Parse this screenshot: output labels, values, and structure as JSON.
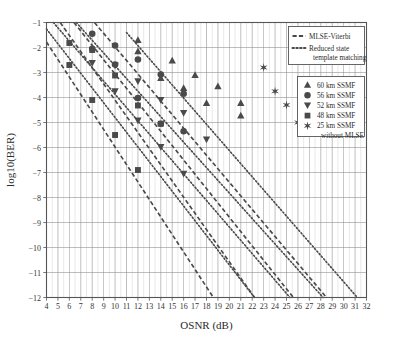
{
  "chart_data": {
    "type": "line",
    "title": "",
    "xlabel": "OSNR (dB)",
    "ylabel": "log10(BER)",
    "xlim": [
      4,
      32
    ],
    "ylim": [
      -12,
      -1
    ],
    "xticks": [
      4,
      5,
      6,
      7,
      8,
      9,
      10,
      11,
      12,
      13,
      14,
      15,
      16,
      17,
      18,
      19,
      20,
      21,
      22,
      23,
      24,
      25,
      26,
      27,
      28,
      29,
      30,
      31,
      32
    ],
    "yticks": [
      -1,
      -2,
      -3,
      -4,
      -5,
      -6,
      -7,
      -8,
      -9,
      -10,
      -11,
      -12
    ],
    "xtick_labels": [
      "4",
      "5",
      "6",
      "7",
      "8",
      "9",
      "10",
      "11",
      "12",
      "13",
      "14",
      "15",
      "16",
      "17",
      "18",
      "19",
      "20",
      "21",
      "22",
      "23",
      "24",
      "25",
      "26",
      "27",
      "28",
      "29",
      "30",
      "31",
      "32"
    ],
    "ytick_labels": [
      "−1",
      "−2",
      "−3",
      "−4",
      "−5",
      "−6",
      "−7",
      "−8",
      "−9",
      "−10",
      "−11",
      "−12"
    ],
    "grid": true,
    "legend_position": "upper-right",
    "series": [
      {
        "name": "48 km SSMF MLSE-Viterbi",
        "distance_km": 48,
        "method": "MLSE-Viterbi",
        "style": "dashed",
        "marker": "square",
        "line": [
          [
            4,
            -1.78
          ],
          [
            18.6,
            -12.0
          ]
        ],
        "points": [
          [
            6,
            -2.7
          ],
          [
            8,
            -4.1
          ],
          [
            10,
            -5.5
          ],
          [
            12,
            -6.9
          ]
        ]
      },
      {
        "name": "48 km SSMF Reduced state template matching",
        "distance_km": 48,
        "method": "Reduced state template matching",
        "style": "dotted",
        "marker": "square",
        "line": [
          [
            4,
            -1.26
          ],
          [
            22.2,
            -12.0
          ]
        ],
        "points": [
          [
            6,
            -1.82
          ],
          [
            8,
            -2.1
          ],
          [
            10,
            -3.12
          ],
          [
            12,
            -4.32
          ],
          [
            14,
            -5.05
          ]
        ]
      },
      {
        "name": "52 km SSMF MLSE-Viterbi",
        "distance_km": 52,
        "method": "MLSE-Viterbi",
        "style": "dashed",
        "marker": "triangle-down",
        "line": [
          [
            5.2,
            -1.0
          ],
          [
            22.2,
            -12.0
          ]
        ],
        "points": [
          [
            8,
            -2.62
          ],
          [
            10,
            -3.75
          ],
          [
            12,
            -4.92
          ],
          [
            14,
            -5.98
          ],
          [
            16,
            -7.05
          ]
        ]
      },
      {
        "name": "52 km SSMF Reduced state template matching",
        "distance_km": 52,
        "method": "Reduced state template matching",
        "style": "dotted",
        "marker": "triangle-down",
        "line": [
          [
            4.6,
            -1.0
          ],
          [
            25.3,
            -12.0
          ]
        ],
        "points": [
          [
            10,
            -2.72
          ],
          [
            12,
            -3.35
          ],
          [
            14,
            -4.1
          ],
          [
            16,
            -4.62
          ],
          [
            18,
            -5.68
          ]
        ]
      },
      {
        "name": "56 km SSMF MLSE-Viterbi",
        "distance_km": 56,
        "method": "MLSE-Viterbi",
        "style": "dashed",
        "marker": "circle",
        "line": [
          [
            6.4,
            -1.0
          ],
          [
            25.6,
            -12.0
          ]
        ],
        "points": [
          [
            8,
            -2.05
          ],
          [
            10,
            -2.68
          ],
          [
            12,
            -4.02
          ],
          [
            14,
            -5.05
          ],
          [
            16,
            -5.35
          ]
        ]
      },
      {
        "name": "56 km SSMF Reduced state template matching",
        "distance_km": 56,
        "method": "Reduced state template matching",
        "style": "dotted",
        "marker": "circle",
        "line": [
          [
            6.6,
            -1.0
          ],
          [
            28.2,
            -12.0
          ]
        ],
        "points": [
          [
            8,
            -1.45
          ],
          [
            10,
            -1.92
          ],
          [
            12,
            -2.48
          ],
          [
            14,
            -3.08
          ],
          [
            16,
            -3.85
          ]
        ]
      },
      {
        "name": "60 km SSMF MLSE-Viterbi",
        "distance_km": 60,
        "method": "MLSE-Viterbi",
        "style": "dashed",
        "marker": "triangle-up",
        "line": [
          [
            8.2,
            -1.0
          ],
          [
            28.5,
            -12.0
          ]
        ],
        "points": [
          [
            12,
            -2.15
          ],
          [
            14,
            -3.22
          ],
          [
            16,
            -3.62
          ],
          [
            18,
            -4.22
          ],
          [
            21,
            -4.72
          ]
        ]
      },
      {
        "name": "60 km SSMF Reduced state template matching",
        "distance_km": 60,
        "method": "Reduced state template matching",
        "style": "dotted",
        "marker": "triangle-up",
        "line": [
          [
            11.0,
            -1.4
          ],
          [
            31.2,
            -12.0
          ]
        ],
        "points": [
          [
            12,
            -1.7
          ],
          [
            15,
            -2.52
          ],
          [
            17,
            -3.1
          ],
          [
            19,
            -3.55
          ],
          [
            21,
            -4.22
          ]
        ]
      },
      {
        "name": "25 km SSMF without MLSE",
        "distance_km": 25,
        "method": "without MLSE",
        "style": "markers-only",
        "marker": "star",
        "points": [
          [
            23,
            -2.8
          ],
          [
            24,
            -3.75
          ],
          [
            25,
            -4.3
          ],
          [
            26,
            -5.0
          ]
        ]
      }
    ]
  },
  "legend": {
    "line_style_box": [
      {
        "label": "MLSE-Viterbi",
        "style": "dashed"
      },
      {
        "label": "Reduced state",
        "label2": "template matching",
        "style": "dotted"
      }
    ],
    "marker_box": [
      {
        "label": "60 km SSMF",
        "marker": "triangle-up"
      },
      {
        "label": "56 km SSMF",
        "marker": "circle"
      },
      {
        "label": "52 km SSMF",
        "marker": "triangle-down"
      },
      {
        "label": "48 km SSMF",
        "marker": "square"
      },
      {
        "label": "25 km SSMF",
        "label2": "without MLSE",
        "marker": "star"
      }
    ]
  },
  "colors": {
    "line": "#4a4a4a",
    "grid_major": "#8a8a8a",
    "grid_minor": "#cccccc",
    "axis": "#555555",
    "text": "#2b2b2b",
    "background": "#ffffff"
  }
}
